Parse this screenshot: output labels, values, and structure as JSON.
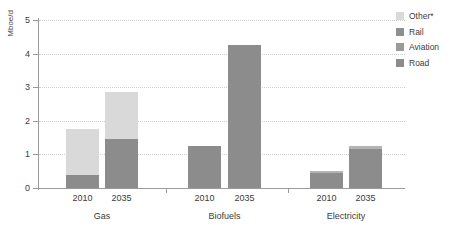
{
  "chart_data": {
    "type": "bar",
    "stacked": true,
    "title": "",
    "xlabel": "",
    "ylabel": "Mboe/d",
    "ylim": [
      0,
      5
    ],
    "yticks": [
      0,
      1,
      2,
      3,
      4,
      5
    ],
    "ytick_labels": [
      "0",
      "1",
      "2",
      "3",
      "4",
      "5"
    ],
    "grid": true,
    "legend_position": "right",
    "groups": [
      {
        "name": "Gas",
        "categories": [
          "2010",
          "2035"
        ]
      },
      {
        "name": "Biofuels",
        "categories": [
          "2010",
          "2035"
        ]
      },
      {
        "name": "Electricity",
        "categories": [
          "2010",
          "2035"
        ]
      }
    ],
    "categories": [
      "Gas 2010",
      "Gas 2035",
      "Biofuels 2010",
      "Biofuels 2035",
      "Electricity 2010",
      "Electricity 2035"
    ],
    "series": [
      {
        "name": "Road",
        "color": "#8c8c8c",
        "values": [
          0.4,
          1.45,
          1.25,
          4.25,
          0.45,
          1.15
        ]
      },
      {
        "name": "Aviation",
        "color": "#a0a0a0",
        "values": [
          0.0,
          0.0,
          0.0,
          0.0,
          0.0,
          0.0
        ]
      },
      {
        "name": "Rail",
        "color": "#b4b4b4",
        "values": [
          0.0,
          0.0,
          0.0,
          0.0,
          0.05,
          0.1
        ]
      },
      {
        "name": "Other*",
        "color": "#d9d9d9",
        "values": [
          1.35,
          1.4,
          0.0,
          0.0,
          0.0,
          0.0
        ]
      }
    ],
    "totals": [
      1.75,
      2.85,
      1.25,
      4.25,
      0.5,
      1.25
    ]
  },
  "legend": {
    "items": [
      {
        "label": "Other*",
        "color": "#d9d9d9"
      },
      {
        "label": "Rail",
        "color": "#8f8f8f"
      },
      {
        "label": "Aviation",
        "color": "#9a9a9a"
      },
      {
        "label": "Road",
        "color": "#8c8c8c"
      }
    ]
  },
  "axis": {
    "y_title": "Mboe/d"
  },
  "colors": {
    "axis": "#9a9a9a",
    "grid": "#cfcfcf",
    "text": "#3b3b3b",
    "background": "#ffffff"
  }
}
